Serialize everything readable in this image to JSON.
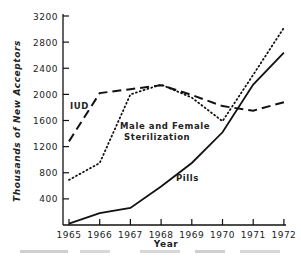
{
  "chart_data": {
    "type": "line",
    "title": "",
    "xlabel": "Year",
    "ylabel": "Thousands of New Acceptors",
    "x": [
      1965,
      1966,
      1967,
      1968,
      1969,
      1970,
      1971,
      1972
    ],
    "x_tick_labels": [
      "1965",
      "1966",
      "1967",
      "1968",
      "1969",
      "1970",
      "1971",
      "1972"
    ],
    "y_ticks": [
      400,
      800,
      1200,
      1600,
      2000,
      2400,
      2800,
      3200
    ],
    "y_tick_labels": [
      "400",
      "800",
      "1200",
      "1600",
      "2000",
      "2400",
      "2800",
      "3200"
    ],
    "ylim": [
      0,
      3200
    ],
    "grid": false,
    "legend": "inline labels",
    "series": [
      {
        "name": "IUD",
        "style": "dashed",
        "values": [
          1280,
          2020,
          2080,
          2140,
          1990,
          1820,
          1750,
          1880
        ]
      },
      {
        "name": "Male and Female Sterilization",
        "style": "dotted",
        "values": [
          690,
          950,
          2000,
          2150,
          1950,
          1590,
          2300,
          3020
        ]
      },
      {
        "name": "Pills",
        "style": "solid",
        "values": [
          20,
          180,
          260,
          590,
          950,
          1420,
          2150,
          2640
        ]
      }
    ]
  },
  "labels": {
    "iud": "IUD",
    "sterilization_line1": "Male and Female",
    "sterilization_line2": "Sterilization",
    "pills": "Pills",
    "xlabel": "Year",
    "ylabel": "Thousands of New Acceptors"
  }
}
